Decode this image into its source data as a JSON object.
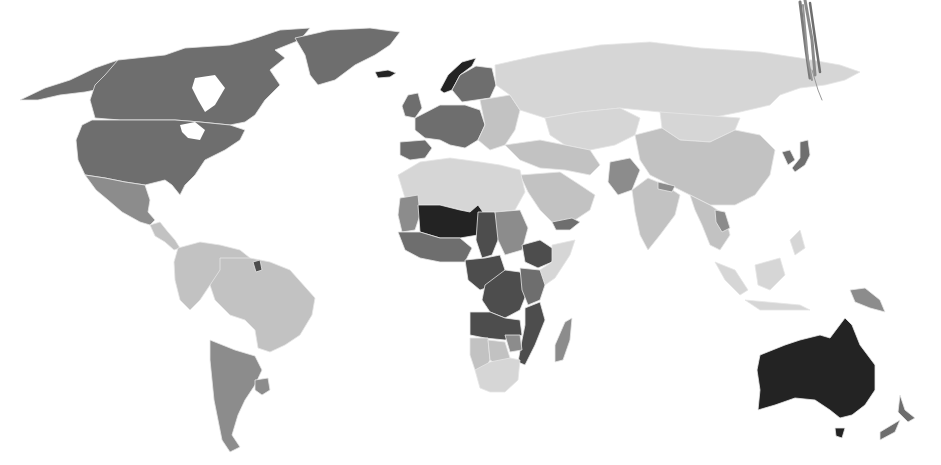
{
  "map": {
    "type": "choropleth",
    "projection": "robinson-like world map",
    "background": "#ffffff",
    "border_color": "#e6e6e6",
    "legend_visible": false,
    "title_visible": false,
    "shade_classes": [
      {
        "name": "lightest",
        "color": "#d6d6d6"
      },
      {
        "name": "light",
        "color": "#c2c2c2"
      },
      {
        "name": "medium",
        "color": "#8c8c8c"
      },
      {
        "name": "medium-dark",
        "color": "#6e6e6e"
      },
      {
        "name": "dark",
        "color": "#4d4d4d"
      },
      {
        "name": "darkest",
        "color": "#232323"
      }
    ],
    "regions": [
      {
        "id": "alaska",
        "label": "Alaska",
        "shade": "medium-dark"
      },
      {
        "id": "canada",
        "label": "Canada",
        "shade": "medium-dark"
      },
      {
        "id": "usa",
        "label": "United States",
        "shade": "medium-dark"
      },
      {
        "id": "greenland",
        "label": "Greenland",
        "shade": "medium-dark"
      },
      {
        "id": "iceland",
        "label": "Iceland",
        "shade": "darkest"
      },
      {
        "id": "mexico",
        "label": "Mexico",
        "shade": "medium"
      },
      {
        "id": "central-america",
        "label": "Central America",
        "shade": "light"
      },
      {
        "id": "south-america-north",
        "label": "Northern South America",
        "shade": "light"
      },
      {
        "id": "brazil",
        "label": "Brazil",
        "shade": "light"
      },
      {
        "id": "argentina-chile",
        "label": "Argentina / Chile",
        "shade": "medium"
      },
      {
        "id": "uruguay",
        "label": "Uruguay",
        "shade": "medium"
      },
      {
        "id": "french-guiana",
        "label": "French Guiana",
        "shade": "dark"
      },
      {
        "id": "uk-ireland",
        "label": "UK / Ireland",
        "shade": "medium-dark"
      },
      {
        "id": "norway",
        "label": "Norway",
        "shade": "darkest"
      },
      {
        "id": "sweden-finland",
        "label": "Sweden / Finland",
        "shade": "medium-dark"
      },
      {
        "id": "western-europe",
        "label": "Western Europe",
        "shade": "medium-dark"
      },
      {
        "id": "iberia",
        "label": "Iberia",
        "shade": "medium-dark"
      },
      {
        "id": "eastern-europe",
        "label": "Eastern Europe",
        "shade": "light"
      },
      {
        "id": "russia",
        "label": "Russia",
        "shade": "lightest"
      },
      {
        "id": "central-asia",
        "label": "Central Asia",
        "shade": "lightest"
      },
      {
        "id": "mongolia",
        "label": "Mongolia",
        "shade": "lightest"
      },
      {
        "id": "china",
        "label": "China",
        "shade": "light"
      },
      {
        "id": "korea",
        "label": "South Korea",
        "shade": "medium-dark"
      },
      {
        "id": "japan",
        "label": "Japan",
        "shade": "medium-dark"
      },
      {
        "id": "middle-east",
        "label": "Middle East",
        "shade": "light"
      },
      {
        "id": "arabia",
        "label": "Arabian Peninsula",
        "shade": "light"
      },
      {
        "id": "yemen",
        "label": "Yemen",
        "shade": "medium-dark"
      },
      {
        "id": "pakistan",
        "label": "Pakistan",
        "shade": "medium"
      },
      {
        "id": "india",
        "label": "India",
        "shade": "light"
      },
      {
        "id": "nepal",
        "label": "Nepal",
        "shade": "medium"
      },
      {
        "id": "southeast-asia",
        "label": "Southeast Asia",
        "shade": "light"
      },
      {
        "id": "laos",
        "label": "Laos",
        "shade": "medium"
      },
      {
        "id": "indonesia",
        "label": "Indonesia / Philippines",
        "shade": "lightest"
      },
      {
        "id": "png",
        "label": "Papua New Guinea",
        "shade": "medium"
      },
      {
        "id": "north-africa",
        "label": "North Africa",
        "shade": "lightest"
      },
      {
        "id": "mauritania",
        "label": "Mauritania",
        "shade": "medium"
      },
      {
        "id": "mali-niger",
        "label": "Mali / Niger",
        "shade": "darkest"
      },
      {
        "id": "chad",
        "label": "Chad",
        "shade": "dark"
      },
      {
        "id": "west-africa",
        "label": "West Africa coast",
        "shade": "medium-dark"
      },
      {
        "id": "sudan",
        "label": "Sudan",
        "shade": "medium"
      },
      {
        "id": "ethiopia",
        "label": "Ethiopia",
        "shade": "dark"
      },
      {
        "id": "somalia",
        "label": "Somalia",
        "shade": "lightest"
      },
      {
        "id": "central-africa",
        "label": "Central Africa",
        "shade": "dark"
      },
      {
        "id": "drc",
        "label": "DR Congo",
        "shade": "dark"
      },
      {
        "id": "east-africa",
        "label": "East Africa",
        "shade": "medium-dark"
      },
      {
        "id": "angola-zambia",
        "label": "Angola / Zambia",
        "shade": "dark"
      },
      {
        "id": "mozambique",
        "label": "Mozambique",
        "shade": "dark"
      },
      {
        "id": "namibia",
        "label": "Namibia",
        "shade": "light"
      },
      {
        "id": "botswana",
        "label": "Botswana",
        "shade": "light"
      },
      {
        "id": "zimbabwe",
        "label": "Zimbabwe",
        "shade": "medium"
      },
      {
        "id": "south-africa",
        "label": "South Africa",
        "shade": "lightest"
      },
      {
        "id": "madagascar",
        "label": "Madagascar",
        "shade": "medium"
      },
      {
        "id": "australia",
        "label": "Australia",
        "shade": "darkest"
      },
      {
        "id": "tasmania",
        "label": "Tasmania",
        "shade": "darkest"
      },
      {
        "id": "new-zealand",
        "label": "New Zealand",
        "shade": "medium-dark"
      }
    ],
    "annotations": [
      {
        "id": "pen-scribble",
        "description": "grey hand-drawn pen strokes over Bering Strait area",
        "color": "#7a7a7a"
      }
    ]
  }
}
